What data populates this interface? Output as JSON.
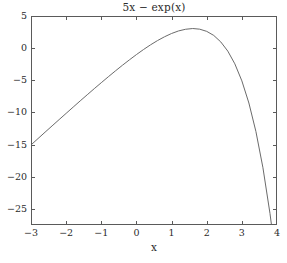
{
  "chart_data": {
    "type": "line",
    "title": "5x − exp(x)",
    "xlabel": "x",
    "ylabel": "",
    "xlim": [
      -3,
      4
    ],
    "ylim": [
      -27.5,
      5
    ],
    "grid": false,
    "legend": null,
    "legend_position": "none",
    "line_color": "#6b6b6b",
    "axis_color": "#5a5a5a",
    "background_color": "#ffffff",
    "tick_direction": "in",
    "box": true,
    "xticks": [
      -3,
      -2,
      -1,
      0,
      1,
      2,
      3,
      4
    ],
    "xtick_labels": [
      "−3",
      "−2",
      "−1",
      "0",
      "1",
      "2",
      "3",
      "4"
    ],
    "yticks": [
      5,
      0,
      -5,
      -10,
      -15,
      -20,
      -25
    ],
    "ytick_labels": [
      "5",
      "0",
      "−5",
      "−10",
      "−15",
      "−20",
      "−25"
    ],
    "series": [
      {
        "name": "5x - exp(x)",
        "x": [
          -3,
          -2.8,
          -2.6,
          -2.4,
          -2.2,
          -2,
          -1.8,
          -1.6,
          -1.4,
          -1.2,
          -1,
          -0.8,
          -0.6,
          -0.4,
          -0.2,
          0,
          0.2,
          0.4,
          0.6,
          0.8,
          1,
          1.2,
          1.4,
          1.6,
          1.609,
          1.8,
          2,
          2.2,
          2.4,
          2.6,
          2.8,
          3,
          3.2,
          3.4,
          3.6,
          3.8,
          3.9,
          4
        ],
        "y": [
          -15.05,
          -14.06,
          -13.07,
          -12.09,
          -11.11,
          -10.14,
          -9.17,
          -8.2,
          -7.25,
          -6.3,
          -5.37,
          -4.45,
          -3.55,
          -2.67,
          -1.82,
          -1,
          -0.22,
          0.51,
          1.18,
          1.77,
          2.28,
          2.68,
          2.94,
          3.05,
          3.05,
          2.95,
          2.61,
          1.98,
          0.97,
          -0.46,
          -2.44,
          -5.09,
          -8.53,
          -12.96,
          -18.6,
          -25.7,
          -29.9,
          -34.6
        ]
      }
    ],
    "annotations": [],
    "peak": {
      "x": 1.609,
      "y": 3.05
    }
  },
  "figure": {
    "title": "5x − exp(x)",
    "xaxis_label": "x"
  }
}
